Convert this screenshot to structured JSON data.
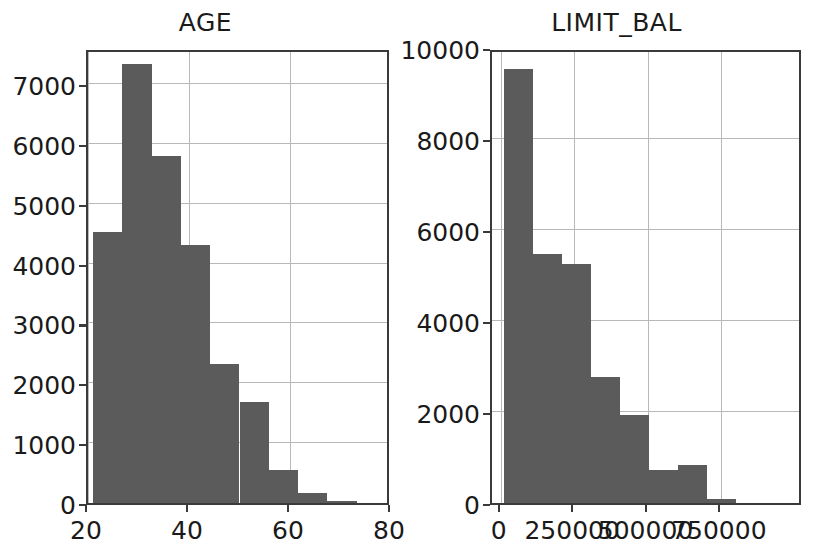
{
  "figure": {
    "background_color": "#ffffff",
    "bar_color": "#5b5b5b",
    "axis_color": "#3a3a3a",
    "grid_color": "#b8b8b8"
  },
  "chart_data": [
    {
      "type": "bar",
      "title": "AGE",
      "xlabel": "",
      "ylabel": "",
      "xlim": [
        20,
        80
      ],
      "ylim": [
        0,
        7600
      ],
      "grid": true,
      "legend": "none",
      "xticks": [
        "20",
        "40",
        "60",
        "80"
      ],
      "xtick_values": [
        20,
        40,
        60,
        80
      ],
      "yticks": [
        "0",
        "1000",
        "2000",
        "3000",
        "4000",
        "5000",
        "6000",
        "7000"
      ],
      "ytick_values": [
        0,
        1000,
        2000,
        3000,
        4000,
        5000,
        6000,
        7000
      ],
      "bin_edges": [
        21,
        26.8,
        32.6,
        38.4,
        44.2,
        50,
        55.8,
        61.6,
        67.4,
        73.2,
        79
      ],
      "categories": [
        "21-26.8",
        "26.8-32.6",
        "32.6-38.4",
        "38.4-44.2",
        "44.2-50",
        "50-55.8",
        "55.8-61.6",
        "61.6-67.4",
        "67.4-73.2",
        "73.2-79"
      ],
      "values": [
        4520,
        7330,
        5790,
        4310,
        2320,
        1680,
        550,
        160,
        30,
        5
      ]
    },
    {
      "type": "bar",
      "title": "LIMIT_BAL",
      "xlabel": "",
      "ylabel": "",
      "xlim": [
        -30000,
        1030000
      ],
      "ylim": [
        0,
        10000
      ],
      "grid": true,
      "legend": "none",
      "xticks": [
        "0",
        "250000",
        "500000",
        "750000"
      ],
      "xtick_values": [
        0,
        250000,
        500000,
        750000
      ],
      "yticks": [
        "0",
        "2000",
        "4000",
        "6000",
        "8000",
        "10000"
      ],
      "ytick_values": [
        0,
        2000,
        4000,
        6000,
        8000,
        10000
      ],
      "bin_edges": [
        10000,
        109000,
        208000,
        307000,
        406000,
        505000,
        604000,
        703000,
        802000,
        901000,
        1000000
      ],
      "categories": [
        "10000-109000",
        "109000-208000",
        "208000-307000",
        "307000-406000",
        "406000-505000",
        "505000-604000",
        "604000-703000",
        "703000-802000",
        "802000-901000",
        "901000-1000000"
      ],
      "values": [
        9530,
        5480,
        5250,
        2770,
        1940,
        720,
        830,
        90,
        10,
        5
      ]
    }
  ]
}
